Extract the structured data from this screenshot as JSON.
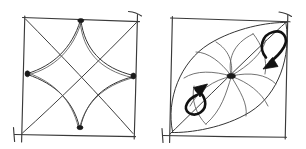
{
  "figure": {
    "background_color": "#ffffff",
    "ink_color": "#2b2b2b",
    "node_color": "#1a1a1a",
    "arrow_color": "#111111",
    "style": "hand-drawn pen sketch",
    "width": 306,
    "height": 149
  },
  "panels": [
    {
      "id": "left-panel",
      "name": "astroid-in-square",
      "description": "Hand-drawn square with both diagonals and an inscribed four-pointed astroid star whose cusps touch the midpoints of the sides",
      "square": {
        "corners": [
          [
            25,
            18
          ],
          [
            137,
            22
          ],
          [
            133,
            137
          ],
          [
            21,
            132
          ]
        ],
        "overshoot": true
      },
      "diagonals": [
        {
          "from": [
            25,
            18
          ],
          "to": [
            133,
            137
          ]
        },
        {
          "from": [
            137,
            22
          ],
          "to": [
            21,
            132
          ]
        }
      ],
      "cusps": [
        {
          "name": "top-cusp",
          "point": [
            81,
            20
          ]
        },
        {
          "name": "right-cusp",
          "point": [
            134,
            76
          ]
        },
        {
          "name": "bottom-cusp",
          "point": [
            80,
            128
          ]
        },
        {
          "name": "left-cusp",
          "point": [
            27,
            73
          ]
        }
      ],
      "node_count": 4,
      "astroid_arcs": 4
    },
    {
      "id": "right-panel",
      "name": "lens-with-rotation-arrows",
      "description": "Hand-drawn square with one diagonal carrying a lens (vesica) shape pinched at a central node, with curved fan lines radiating from the node and two curved rotation arrows inside the two lobes",
      "square": {
        "corners": [
          [
            172,
            18
          ],
          [
            288,
            22
          ],
          [
            285,
            137
          ],
          [
            169,
            133
          ]
        ],
        "overshoot": true
      },
      "diagonal": {
        "from": [
          170,
          133
        ],
        "to": [
          287,
          22
        ]
      },
      "center_node": {
        "point": [
          231,
          76
        ],
        "filled": true
      },
      "lobes": [
        {
          "name": "upper-right-lobe",
          "arrow": "clockwise-arrow-down-left"
        },
        {
          "name": "lower-left-lobe",
          "arrow": "counterclockwise-arrow-up-right"
        }
      ],
      "fan_curves": 10,
      "arrows": [
        {
          "id": "arrow-upper",
          "name": "rotation-arrow-upper",
          "direction": "down-left",
          "loop": "open curved loop",
          "head_point": [
            273,
            63
          ]
        },
        {
          "id": "arrow-lower",
          "name": "rotation-arrow-lower",
          "direction": "up-right",
          "loop": "open curved loop",
          "head_point": [
            197,
            92
          ]
        }
      ]
    }
  ]
}
